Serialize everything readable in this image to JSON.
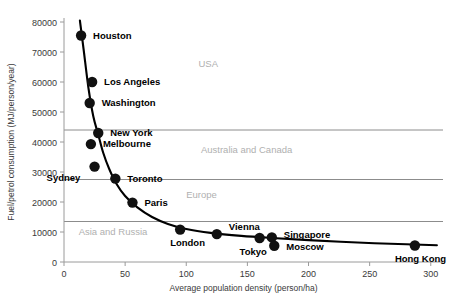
{
  "chart_data": {
    "type": "scatter",
    "title": "",
    "xlabel": "Average population density (person/ha)",
    "ylabel": "Fuel/petrol consumption (MJ/person/year)",
    "xlim": [
      0,
      310
    ],
    "ylim": [
      0,
      80000
    ],
    "xticks": [
      0,
      50,
      100,
      150,
      200,
      250,
      300
    ],
    "xtick_labels": [
      "0",
      "50",
      "100",
      "150",
      "200",
      "250",
      "300"
    ],
    "yticks": [
      0,
      10000,
      20000,
      30000,
      40000,
      50000,
      60000,
      70000,
      80000
    ],
    "ytick_labels": [
      "0",
      "10000",
      "20000",
      "30000",
      "40000",
      "50000",
      "60000",
      "70000",
      "80000"
    ],
    "grid": false,
    "legend": "none",
    "points": [
      {
        "label": "Houston",
        "x": 14,
        "y": 75500,
        "label_dx": 12,
        "label_dy": 3
      },
      {
        "label": "Los Angeles",
        "x": 23,
        "y": 60000,
        "label_dx": 12,
        "label_dy": 3
      },
      {
        "label": "Washington",
        "x": 21,
        "y": 53000,
        "label_dx": 12,
        "label_dy": 3
      },
      {
        "label": "New York",
        "x": 28,
        "y": 43000,
        "label_dx": 12,
        "label_dy": 3
      },
      {
        "label": "Melbourne",
        "x": 22,
        "y": 39300,
        "label_dx": 12,
        "label_dy": 3
      },
      {
        "label": "Sydney",
        "x": 25,
        "y": 31800,
        "label_dx": -48,
        "label_dy": 14
      },
      {
        "label": "Toronto",
        "x": 42,
        "y": 27800,
        "label_dx": 12,
        "label_dy": 3
      },
      {
        "label": "Paris",
        "x": 56,
        "y": 19800,
        "label_dx": 12,
        "label_dy": 3
      },
      {
        "label": "London",
        "x": 95,
        "y": 10800,
        "label_dx": -10,
        "label_dy": 16
      },
      {
        "label": "Vienna",
        "x": 125,
        "y": 9300,
        "label_dx": 12,
        "label_dy": -4
      },
      {
        "label": "Tokyo",
        "x": 160,
        "y": 8000,
        "label_dx": -20,
        "label_dy": 17
      },
      {
        "label": "Singapore",
        "x": 170,
        "y": 8200,
        "label_dx": 12,
        "label_dy": 1
      },
      {
        "label": "Moscow",
        "x": 172,
        "y": 5400,
        "label_dx": 12,
        "label_dy": 4
      },
      {
        "label": "Hong Kong",
        "x": 287,
        "y": 5500,
        "label_dx": -20,
        "label_dy": 16
      }
    ],
    "trend_curve": {
      "description": "fitted declining power-law curve",
      "points": [
        {
          "x": 13,
          "y": 80500
        },
        {
          "x": 16,
          "y": 71000
        },
        {
          "x": 20,
          "y": 58000
        },
        {
          "x": 24,
          "y": 48500
        },
        {
          "x": 28,
          "y": 42500
        },
        {
          "x": 32,
          "y": 36500
        },
        {
          "x": 37,
          "y": 31000
        },
        {
          "x": 43,
          "y": 26000
        },
        {
          "x": 50,
          "y": 22000
        },
        {
          "x": 60,
          "y": 18200
        },
        {
          "x": 72,
          "y": 15000
        },
        {
          "x": 85,
          "y": 12700
        },
        {
          "x": 100,
          "y": 11000
        },
        {
          "x": 120,
          "y": 9700
        },
        {
          "x": 145,
          "y": 8700
        },
        {
          "x": 170,
          "y": 8000
        },
        {
          "x": 200,
          "y": 7300
        },
        {
          "x": 240,
          "y": 6500
        },
        {
          "x": 280,
          "y": 5900
        },
        {
          "x": 305,
          "y": 5600
        }
      ]
    },
    "separator_lines": [
      {
        "y": 44000,
        "name": "usa-australia-divider"
      },
      {
        "y": 27500,
        "name": "australia-europe-divider"
      },
      {
        "y": 13500,
        "name": "europe-asia-divider"
      }
    ],
    "region_labels": [
      {
        "text": "USA",
        "x": 110,
        "y": 65000
      },
      {
        "text": "Australia and Canada",
        "x": 112,
        "y": 36500
      },
      {
        "text": "Europe",
        "x": 100,
        "y": 21500
      },
      {
        "text": "Asia and Russia",
        "x": 12,
        "y": 9000
      }
    ]
  }
}
